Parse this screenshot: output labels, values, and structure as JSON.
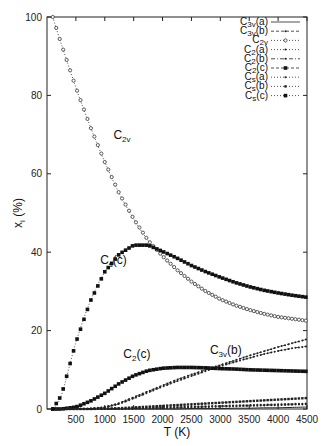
{
  "chart_data": {
    "type": "line",
    "title": "",
    "xlabel": "T (K)",
    "ylabel": "x_i (%)",
    "xlim": [
      0,
      4500
    ],
    "ylim": [
      0,
      100
    ],
    "grid": false,
    "legend_position": "top-right",
    "x_ticks": [
      500,
      1000,
      1500,
      2000,
      2500,
      3000,
      3500,
      4000,
      4500
    ],
    "y_ticks": [
      0,
      20,
      40,
      60,
      80,
      100
    ],
    "x": [
      100,
      250,
      500,
      750,
      1000,
      1250,
      1500,
      1750,
      2000,
      2250,
      2500,
      2750,
      3000,
      3250,
      3500,
      3750,
      4000,
      4250,
      4500
    ],
    "series": [
      {
        "name": "C3v(a)",
        "label_main": "C",
        "label_sub": "3v",
        "label_suffix": "(a)",
        "style": "solid",
        "marker": "none",
        "values": [
          0,
          0,
          0,
          0,
          0,
          0,
          0,
          0,
          0,
          0,
          0.1,
          0.1,
          0.1,
          0.2,
          0.2,
          0.3,
          0.3,
          0.4,
          0.5
        ]
      },
      {
        "name": "C3v(b)",
        "label_main": "C",
        "label_sub": "3v",
        "label_suffix": "(b)",
        "style": "dashed",
        "marker": "small-dot",
        "values": [
          0,
          0,
          0,
          0.1,
          0.5,
          1.5,
          3,
          4.5,
          6,
          7.5,
          8.8,
          10,
          11.2,
          12.4,
          13.6,
          14.7,
          15.8,
          16.8,
          17.8
        ]
      },
      {
        "name": "C2v",
        "label_main": "C",
        "label_sub": "2v",
        "label_suffix": "",
        "style": "dotted",
        "marker": "open-circle",
        "values": [
          100,
          93,
          82,
          72,
          63,
          55,
          48.5,
          43,
          39,
          35.5,
          32.5,
          30,
          28,
          26.5,
          25.3,
          24.3,
          23.5,
          23,
          22.5
        ]
      },
      {
        "name": "C2(a)",
        "label_main": "C",
        "label_sub": "2",
        "label_suffix": "(a)",
        "style": "dotted",
        "marker": "small-dot",
        "values": [
          0,
          0,
          0,
          0,
          0,
          0.1,
          0.2,
          0.3,
          0.4,
          0.5,
          0.6,
          0.7,
          0.8,
          0.9,
          1,
          1.1,
          1.2,
          1.3,
          1.4
        ]
      },
      {
        "name": "C2(b)",
        "label_main": "C",
        "label_sub": "2",
        "label_suffix": "(b)",
        "style": "dash-dot",
        "marker": "small-dot",
        "values": [
          0,
          0,
          0,
          0.1,
          0.4,
          1.3,
          2.7,
          4.2,
          5.7,
          7.1,
          8.4,
          9.7,
          10.9,
          12,
          13,
          14,
          14.8,
          15.5,
          16
        ]
      },
      {
        "name": "C2(c)",
        "label_main": "C",
        "label_sub": "2",
        "label_suffix": "(c)",
        "style": "dashed",
        "marker": "filled-square",
        "values": [
          0,
          0,
          0.5,
          2,
          4,
          6.5,
          8.5,
          9.8,
          10.4,
          10.6,
          10.6,
          10.5,
          10.3,
          10.2,
          10,
          9.9,
          9.8,
          9.7,
          9.6
        ]
      },
      {
        "name": "Cs(a)",
        "label_main": "C",
        "label_sub": "s",
        "label_suffix": "(a)",
        "style": "dotted",
        "marker": "small-dot",
        "values": [
          0,
          0,
          0,
          0,
          0,
          0,
          0.1,
          0.2,
          0.2,
          0.3,
          0.4,
          0.5,
          0.6,
          0.7,
          0.8,
          0.9,
          1,
          1.1,
          1.2
        ]
      },
      {
        "name": "Cs(b)",
        "label_main": "C",
        "label_sub": "s",
        "label_suffix": "(b)",
        "style": "dotted",
        "marker": "filled-square-small",
        "values": [
          0,
          0,
          0,
          0,
          0.1,
          0.2,
          0.4,
          0.6,
          0.8,
          1,
          1.2,
          1.4,
          1.6,
          1.8,
          2,
          2.2,
          2.4,
          2.6,
          2.8
        ]
      },
      {
        "name": "Cs(c)",
        "label_main": "C",
        "label_sub": "s",
        "label_suffix": "(c)",
        "style": "dotted",
        "marker": "filled-square",
        "values": [
          0,
          3.5,
          17,
          27.5,
          35,
          39.5,
          41.8,
          41.8,
          40.2,
          38.5,
          36.6,
          35,
          33.6,
          32.3,
          31.2,
          30.3,
          29.6,
          29,
          28.5
        ]
      }
    ],
    "annotations": [
      {
        "main": "C",
        "sub": "2v",
        "suffix": "",
        "x": 1150,
        "y": 69
      },
      {
        "main": "C",
        "sub": "s",
        "suffix": "(c)",
        "x": 920,
        "y": 37
      },
      {
        "main": "C",
        "sub": "2",
        "suffix": "(c)",
        "x": 1320,
        "y": 13
      },
      {
        "main": "C",
        "sub": "3v",
        "suffix": "(b)",
        "x": 2820,
        "y": 14
      }
    ]
  }
}
